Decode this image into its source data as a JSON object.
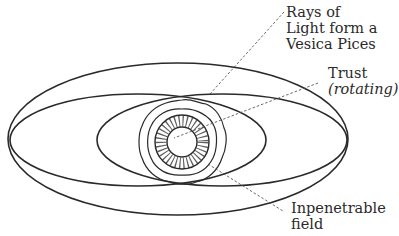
{
  "diagram": {
    "type": "energy-field-diagram",
    "labels": {
      "rays": {
        "line1": "Rays of",
        "line2": "Light form a",
        "line3": "Vesica Pices"
      },
      "trust": {
        "line1": "Trust",
        "line2": "(rotating)"
      },
      "field": {
        "line1": "Inpenetrable",
        "line2": "field"
      }
    },
    "shapes": {
      "outer_ellipse": "large outer oval",
      "vesica": "two overlapping elongated ellipses",
      "core": "inner circle with dotted ring and wavy outer rings"
    },
    "colors": {
      "stroke": "#2a2a2a",
      "background": "#ffffff"
    }
  }
}
